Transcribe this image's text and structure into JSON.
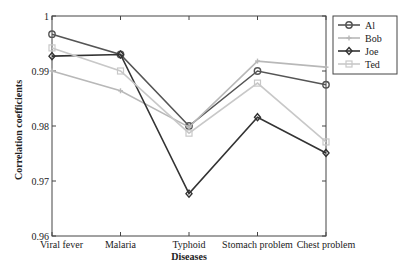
{
  "chart_data": {
    "type": "line",
    "title": "",
    "xlabel": "Diseases",
    "ylabel": "Correlation coefficients",
    "categories": [
      "Viral fever",
      "Malaria",
      "Typhoid",
      "Stomach problem",
      "Chest problem"
    ],
    "ylim": [
      0.96,
      1.0
    ],
    "yticks": [
      0.96,
      0.97,
      0.98,
      0.99,
      1
    ],
    "ytick_labels": [
      "0.96",
      "0.97",
      "0.98",
      "0.99",
      "1"
    ],
    "grid": false,
    "legend_position": "upper right",
    "series": [
      {
        "name": "Al",
        "values": [
          0.9967,
          0.993,
          0.98,
          0.99,
          0.9875
        ],
        "color": "#555555",
        "marker": "circle"
      },
      {
        "name": "Bob",
        "values": [
          0.99,
          0.9864,
          0.9798,
          0.9918,
          0.9907
        ],
        "color": "#b8b8b8",
        "marker": "plus"
      },
      {
        "name": "Joe",
        "values": [
          0.9927,
          0.993,
          0.9677,
          0.9816,
          0.9751
        ],
        "color": "#333333",
        "marker": "diamond"
      },
      {
        "name": "Ted",
        "values": [
          0.9942,
          0.99,
          0.9787,
          0.9878,
          0.9771
        ],
        "color": "#c8c8c8",
        "marker": "square"
      }
    ]
  }
}
